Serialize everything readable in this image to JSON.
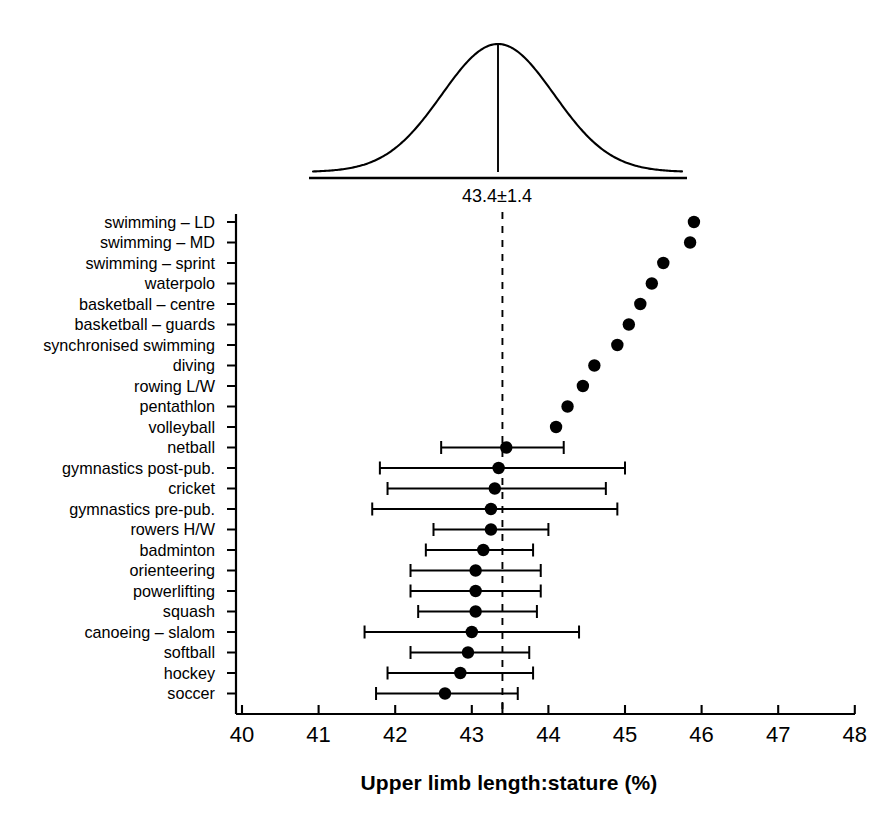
{
  "chart_data": {
    "type": "scatter",
    "title": "",
    "xlabel": "Upper limb length:stature (%)",
    "ylabel": "",
    "xlim": [
      40,
      48
    ],
    "xticks": [
      40,
      41,
      42,
      43,
      44,
      45,
      46,
      47,
      48
    ],
    "xtick_labels": [
      "40",
      "41",
      "42",
      "43",
      "44",
      "45",
      "46",
      "47",
      "48"
    ],
    "grid": false,
    "legend": "none",
    "reference_line": {
      "label": "43.4±1.4",
      "mean": 43.4,
      "sd": 1.4,
      "style": "dashed",
      "note": "population reference distribution shown as normal curve above the plot"
    },
    "categories": [
      "swimming – LD",
      "swimming – MD",
      "swimming – sprint",
      "waterpolo",
      "basketball – centre",
      "basketball – guards",
      "synchronised swimming",
      "diving",
      "rowing L/W",
      "pentathlon",
      "volleyball",
      "netball",
      "gymnastics post-pub.",
      "cricket",
      "gymnastics pre-pub.",
      "rowers H/W",
      "badminton",
      "orienteering",
      "powerlifting",
      "squash",
      "canoeing – slalom",
      "softball",
      "hockey",
      "soccer"
    ],
    "values": [
      45.9,
      45.85,
      45.5,
      45.35,
      45.2,
      45.05,
      44.9,
      44.6,
      44.45,
      44.25,
      44.1,
      43.45,
      43.35,
      43.3,
      43.25,
      43.25,
      43.15,
      43.05,
      43.05,
      43.05,
      43.0,
      42.95,
      42.85,
      42.65
    ],
    "error_low": [
      null,
      null,
      null,
      null,
      null,
      null,
      null,
      null,
      null,
      null,
      null,
      42.6,
      41.8,
      41.9,
      41.7,
      42.5,
      42.4,
      42.2,
      42.2,
      42.3,
      41.6,
      42.2,
      41.9,
      41.75
    ],
    "error_high": [
      null,
      null,
      null,
      null,
      null,
      null,
      null,
      null,
      null,
      null,
      null,
      44.2,
      45.0,
      44.75,
      44.9,
      44.0,
      43.8,
      43.9,
      43.9,
      43.85,
      44.4,
      43.75,
      43.8,
      43.6
    ],
    "marker": "filled-circle",
    "marker_color": "#000000",
    "axis_color": "#000000"
  },
  "figure": {
    "axis_title": "Upper limb length:stature (%)",
    "curve_label": "43.4±1.4"
  }
}
